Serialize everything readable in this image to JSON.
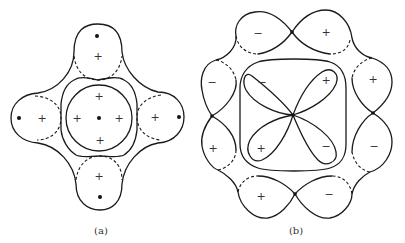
{
  "figure": {
    "panel_a": {
      "caption": "(a)",
      "outer_lobes": [
        {
          "position": "top",
          "sign": "+"
        },
        {
          "position": "left",
          "sign": "+"
        },
        {
          "position": "right",
          "sign": "+"
        },
        {
          "position": "bottom",
          "sign": "+"
        }
      ],
      "inner_circle_signs": [
        "+",
        "+",
        "+",
        "+"
      ],
      "nuclei_dots": 5
    },
    "panel_b": {
      "caption": "(b)",
      "outer_lobes": [
        {
          "position": "top-left",
          "sign": "−"
        },
        {
          "position": "top-right",
          "sign": "+"
        },
        {
          "position": "right-top",
          "sign": "+"
        },
        {
          "position": "right-bottom",
          "sign": "−"
        },
        {
          "position": "bottom-right",
          "sign": "−"
        },
        {
          "position": "bottom-left",
          "sign": "+"
        },
        {
          "position": "left-bottom",
          "sign": "+"
        },
        {
          "position": "left-top",
          "sign": "−"
        }
      ],
      "inner_petals": [
        {
          "position": "upper-left",
          "sign": "−"
        },
        {
          "position": "upper-right",
          "sign": "+"
        },
        {
          "position": "lower-left",
          "sign": "+"
        },
        {
          "position": "lower-right",
          "sign": "−"
        }
      ]
    },
    "colors": {
      "line": "#1a1a1a",
      "background": "#ffffff"
    }
  }
}
